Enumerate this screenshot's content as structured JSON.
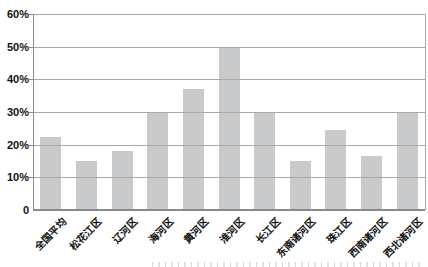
{
  "page": {
    "background": "#ffffff"
  },
  "chart_data": {
    "type": "bar",
    "title": "",
    "xlabel": "",
    "ylabel": "",
    "categories": [
      "全国平均",
      "松花江区",
      "辽河区",
      "海河区",
      "黄河区",
      "淮河区",
      "长江区",
      "东南诸河区",
      "珠江区",
      "西南诸河区",
      "西北诸河区"
    ],
    "values": [
      22.5,
      15,
      18,
      30,
      37,
      50,
      30,
      15,
      24.5,
      16.5,
      30
    ],
    "ylim": [
      0,
      60
    ],
    "ytick_values": [
      0,
      10,
      20,
      30,
      40,
      50,
      60
    ],
    "ytick_labels": [
      "0",
      "10%",
      "20%",
      "30%",
      "40%",
      "50%",
      "60%"
    ],
    "grid": "horizontal",
    "gridlines_over_bars": true,
    "legend": "none",
    "bar_color": "#c9cacb",
    "gridline_color": "#a8a8a8",
    "axis_color": "#8a8a8a",
    "label_color": "#111111"
  }
}
